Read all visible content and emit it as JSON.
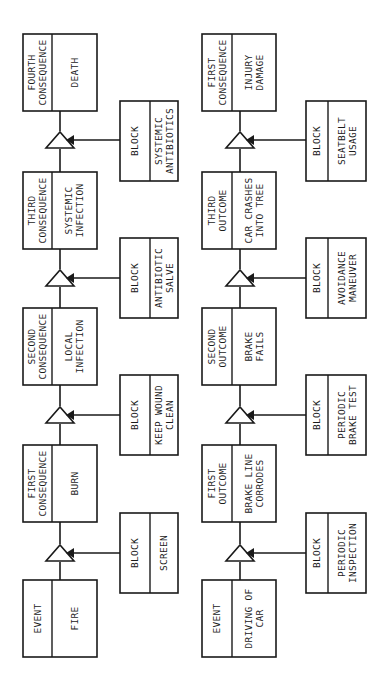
{
  "diagram": {
    "type": "event-consequence-chains",
    "chains": [
      {
        "name": "fire-chain",
        "nodes": [
          {
            "role": "Event",
            "label": "Fire"
          },
          {
            "role": "First Consequence",
            "label": "Burn"
          },
          {
            "role": "Second Consequence",
            "label": "Local Infection"
          },
          {
            "role": "Third Consequence",
            "label": "Systemic Infection"
          },
          {
            "role": "Fourth Consequence",
            "label": "Death"
          }
        ],
        "blocks": [
          {
            "tag": "Block",
            "label": "Screen"
          },
          {
            "tag": "Block",
            "label": "Keep Wound Clean"
          },
          {
            "tag": "Block",
            "label": "Antibiotic Salve"
          },
          {
            "tag": "Block",
            "label": "Systemic Antibiotics"
          }
        ]
      },
      {
        "name": "car-chain",
        "nodes": [
          {
            "role": "Event",
            "label": "Driving of Car"
          },
          {
            "role": "First Outcome",
            "label": "Brake Line Corrodes"
          },
          {
            "role": "Second Outcome",
            "label": "Brake Fails"
          },
          {
            "role": "Third Outcome",
            "label": "Car Crashes into Tree"
          },
          {
            "role": "First Consequence",
            "label": "Injury Damage"
          }
        ],
        "blocks": [
          {
            "tag": "Block",
            "label": "Periodic Inspection"
          },
          {
            "tag": "Block",
            "label": "Periodic Brake Test"
          },
          {
            "tag": "Block",
            "label": "Avoidance Maneuver"
          },
          {
            "tag": "Block",
            "label": "Seatbelt Usage"
          }
        ]
      }
    ]
  },
  "text": {
    "fire": {
      "nodes": [
        {
          "role": [
            "EVENT"
          ],
          "label": [
            "FIRE"
          ]
        },
        {
          "role": [
            "FIRST",
            "CONSEQUENCE"
          ],
          "label": [
            "BURN"
          ]
        },
        {
          "role": [
            "SECOND",
            "CONSEQUENCE"
          ],
          "label": [
            "LOCAL",
            "INFECTION"
          ]
        },
        {
          "role": [
            "THIRD",
            "CONSEQUENCE"
          ],
          "label": [
            "SYSTEMIC",
            "INFECTION"
          ]
        },
        {
          "role": [
            "FOURTH",
            "CONSEQUENCE"
          ],
          "label": [
            "DEATH"
          ]
        }
      ],
      "blocks": [
        {
          "tag": [
            "BLOCK"
          ],
          "label": [
            "SCREEN"
          ]
        },
        {
          "tag": [
            "BLOCK"
          ],
          "label": [
            "KEEP WOUND",
            "CLEAN"
          ]
        },
        {
          "tag": [
            "BLOCK"
          ],
          "label": [
            "ANTIBIOTIC",
            "SALVE"
          ]
        },
        {
          "tag": [
            "BLOCK"
          ],
          "label": [
            "SYSTEMIC",
            "ANTIBIOTICS"
          ]
        }
      ]
    },
    "car": {
      "nodes": [
        {
          "role": [
            "EVENT"
          ],
          "label": [
            "DRIVING OF",
            "CAR"
          ]
        },
        {
          "role": [
            "FIRST",
            "OUTCOME"
          ],
          "label": [
            "BRAKE LINE",
            "CORRODES"
          ]
        },
        {
          "role": [
            "SECOND",
            "OUTCOME"
          ],
          "label": [
            "BRAKE",
            "FAILS"
          ]
        },
        {
          "role": [
            "THIRD",
            "OUTCOME"
          ],
          "label": [
            "CAR CRASHES",
            "INTO TREE"
          ]
        },
        {
          "role": [
            "FIRST",
            "CONSEQUENCE"
          ],
          "label": [
            "INJURY",
            "DAMAGE"
          ]
        }
      ],
      "blocks": [
        {
          "tag": [
            "BLOCK"
          ],
          "label": [
            "PERIODIC",
            "INSPECTION"
          ]
        },
        {
          "tag": [
            "BLOCK"
          ],
          "label": [
            "PERIODIC",
            "BRAKE TEST"
          ]
        },
        {
          "tag": [
            "BLOCK"
          ],
          "label": [
            "AVOIDANCE",
            "MANEUVER"
          ]
        },
        {
          "tag": [
            "BLOCK"
          ],
          "label": [
            "SEATBELT",
            "USAGE"
          ]
        }
      ]
    }
  }
}
